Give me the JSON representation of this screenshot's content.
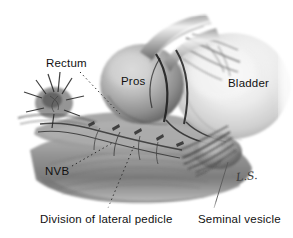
{
  "figure": {
    "medium": "grayscale pencil / wash medical illustration",
    "background_color": "#ffffff",
    "ink_color": "#111111"
  },
  "labels": {
    "rectum": "Rectum",
    "pros": "Pros",
    "bladder": "Bladder",
    "nvb": "NVB",
    "division": "Division of lateral pedicle",
    "seminal": "Seminal vesicle"
  },
  "signature": {
    "text": "L.S.",
    "description": "artist-signature-cursive"
  },
  "leaders": [
    {
      "name": "rectum-leader",
      "from": [
        78,
        72
      ],
      "to": [
        118,
        112
      ],
      "style": "dotted"
    },
    {
      "name": "nvb-leader",
      "from": [
        70,
        166
      ],
      "to": [
        112,
        142
      ],
      "style": "dotted"
    },
    {
      "name": "division-leader",
      "from": [
        108,
        210
      ],
      "to": [
        132,
        146
      ],
      "style": "dotted"
    },
    {
      "name": "seminal-leader",
      "from": [
        212,
        210
      ],
      "to": [
        228,
        160
      ],
      "style": "solid-thin"
    }
  ],
  "structures": [
    {
      "name": "bladder",
      "shape": "large pale ovoid mass, right of frame"
    },
    {
      "name": "prostate",
      "shape": "rounded mid-gray mass, center"
    },
    {
      "name": "urethral-catheter",
      "shape": "tubular highlights arcing up-right from prostate apex"
    },
    {
      "name": "rectum-stump",
      "shape": "radiating fibrous stump, left of frame"
    },
    {
      "name": "lateral-pedicle-tissue",
      "shape": "striated mid-gray tissue band, lower center"
    },
    {
      "name": "neurovascular-bundle",
      "shape": "fan of dark vessel strands descending left"
    },
    {
      "name": "seminal-vesicle",
      "shape": "lobulated mass beneath bladder base, right"
    }
  ]
}
